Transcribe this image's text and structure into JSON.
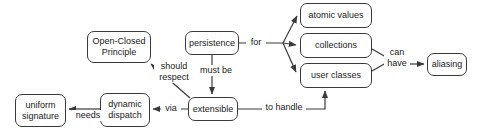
{
  "diagram": {
    "background_color": "#ffffff",
    "stroke_color": "#3a3a3a",
    "text_color": "#1a1a1a",
    "nodes": [
      {
        "id": "open-closed-principle",
        "label": "Open-Closed\nPrinciple",
        "x": 87,
        "y": 31,
        "w": 64,
        "h": 32
      },
      {
        "id": "persistence",
        "label": "persistence",
        "x": 185,
        "y": 31,
        "w": 54,
        "h": 24
      },
      {
        "id": "atomic-values",
        "label": "atomic values",
        "x": 300,
        "y": 3,
        "w": 72,
        "h": 25
      },
      {
        "id": "collections",
        "label": "collections",
        "x": 300,
        "y": 33,
        "w": 72,
        "h": 25
      },
      {
        "id": "user-classes",
        "label": "user classes",
        "x": 300,
        "y": 63,
        "w": 72,
        "h": 25
      },
      {
        "id": "aliasing",
        "label": "aliasing",
        "x": 427,
        "y": 53,
        "w": 40,
        "h": 23
      },
      {
        "id": "uniform-signature",
        "label": "uniform\nsignature",
        "x": 15,
        "y": 94,
        "w": 51,
        "h": 33
      },
      {
        "id": "dynamic-dispatch",
        "label": "dynamic\ndispatch",
        "x": 100,
        "y": 93,
        "w": 50,
        "h": 34
      },
      {
        "id": "extensible",
        "label": "extensible",
        "x": 188,
        "y": 97,
        "w": 50,
        "h": 24
      }
    ],
    "edge_labels": [
      {
        "id": "for",
        "label": "for",
        "x": 248,
        "y": 38,
        "w": 16
      },
      {
        "id": "can-have",
        "label": "can\nhave",
        "x": 385,
        "y": 48,
        "w": 22
      },
      {
        "id": "must-be",
        "label": "must be",
        "x": 198,
        "y": 66,
        "w": 36
      },
      {
        "id": "should-respect",
        "label": "should\nrespect",
        "x": 155,
        "y": 62,
        "w": 36
      },
      {
        "id": "via",
        "label": "via",
        "x": 162,
        "y": 104,
        "w": 16
      },
      {
        "id": "to-handle",
        "label": "to handle",
        "x": 263,
        "y": 102,
        "w": 40
      },
      {
        "id": "needs",
        "label": "needs",
        "x": 73,
        "y": 111,
        "w": 28
      }
    ],
    "edges": [
      {
        "id": "persistence-for-atomic-values",
        "from": "persistence",
        "to": "atomic-values",
        "label": "for"
      },
      {
        "id": "persistence-for-collections",
        "from": "persistence",
        "to": "collections",
        "label": "for"
      },
      {
        "id": "persistence-for-user-classes",
        "from": "persistence",
        "to": "user-classes",
        "label": "for"
      },
      {
        "id": "collections-can-have-aliasing",
        "from": "collections",
        "to": "aliasing",
        "label": "can have"
      },
      {
        "id": "user-classes-can-have-aliasing",
        "from": "user-classes",
        "to": "aliasing",
        "label": "can have"
      },
      {
        "id": "persistence-must-be-extensible",
        "from": "persistence",
        "to": "extensible",
        "label": "must be"
      },
      {
        "id": "extensible-should-respect-ocp",
        "from": "extensible",
        "to": "open-closed-principle",
        "label": "should respect"
      },
      {
        "id": "extensible-via-dynamic-dispatch",
        "from": "extensible",
        "to": "dynamic-dispatch",
        "label": "via"
      },
      {
        "id": "dynamic-dispatch-needs-uniform-signature",
        "from": "dynamic-dispatch",
        "to": "uniform-signature",
        "label": "needs"
      },
      {
        "id": "extensible-to-handle-user-classes",
        "from": "extensible",
        "to": "user-classes",
        "label": "to handle"
      }
    ]
  }
}
